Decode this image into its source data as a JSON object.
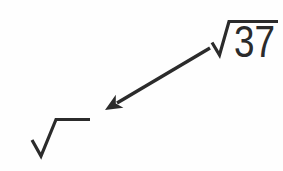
{
  "colors": {
    "ink": "#2b2b2b",
    "background": "#fefefe"
  },
  "source_radical": {
    "symbol": "√",
    "radicand": "37"
  },
  "target_radical": {
    "symbol": "√",
    "radicand": ""
  },
  "arrow": {
    "from": "source-radical",
    "to": "target-radical",
    "direction": "down-left"
  }
}
